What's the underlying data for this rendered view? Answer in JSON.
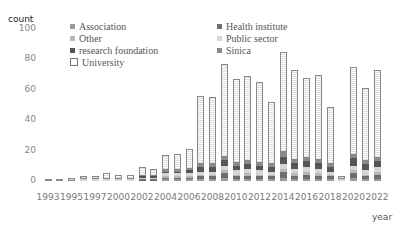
{
  "chart_data": {
    "type": "bar",
    "stacked": true,
    "title": "",
    "xlabel": "year",
    "ylabel": "count",
    "ylim": [
      0,
      100
    ],
    "yticks": [
      0,
      20,
      40,
      60,
      80,
      100
    ],
    "grid": false,
    "legend_position": "top-left inside",
    "categories": [
      "1993",
      "1994",
      "1995",
      "1996",
      "1997",
      "1998",
      "2000",
      "2001",
      "2002",
      "2003",
      "2004",
      "2005",
      "2006",
      "2007",
      "2008",
      "2009",
      "2010",
      "2011",
      "2012",
      "2013",
      "2014",
      "2015",
      "2016",
      "2017",
      "2018",
      "2019",
      "2020",
      "2021",
      "2022"
    ],
    "xtick_labels": [
      "1993",
      "1995",
      "1997",
      "2000",
      "2002",
      "2004",
      "2006",
      "2008",
      "2010",
      "2012",
      "2014",
      "2016",
      "2018",
      "2020",
      "2022"
    ],
    "series": [
      {
        "name": "Association",
        "color": "#9a9a9a",
        "values": [
          0,
          0,
          0,
          0,
          0,
          0,
          0,
          0,
          0,
          0,
          1,
          1,
          1,
          1,
          1,
          2,
          1,
          1,
          1,
          1,
          2,
          1,
          1,
          1,
          1,
          0,
          2,
          1,
          1
        ]
      },
      {
        "name": "Health institute",
        "color": "#6e6e6e",
        "values": [
          0,
          0,
          0,
          0,
          0,
          0,
          0,
          0,
          1,
          1,
          1,
          1,
          1,
          2,
          2,
          3,
          2,
          2,
          2,
          2,
          4,
          2,
          3,
          2,
          2,
          0,
          3,
          2,
          3
        ]
      },
      {
        "name": "Other",
        "color": "#b8b8b8",
        "values": [
          0,
          0,
          0,
          0,
          0,
          0,
          0,
          0,
          0,
          0,
          1,
          1,
          1,
          1,
          1,
          2,
          1,
          2,
          1,
          1,
          2,
          2,
          2,
          2,
          1,
          0,
          2,
          1,
          2
        ]
      },
      {
        "name": "Public sector",
        "color": "#d6d6d6",
        "values": [
          0,
          0,
          0,
          1,
          1,
          1,
          1,
          1,
          1,
          1,
          2,
          2,
          2,
          2,
          2,
          3,
          3,
          3,
          3,
          2,
          3,
          3,
          3,
          3,
          2,
          1,
          3,
          3,
          3
        ]
      },
      {
        "name": "research foundation",
        "color": "#555555",
        "values": [
          0,
          0,
          0,
          0,
          0,
          0,
          0,
          0,
          1,
          1,
          1,
          1,
          2,
          3,
          3,
          4,
          3,
          3,
          3,
          3,
          5,
          4,
          4,
          4,
          3,
          0,
          5,
          4,
          4
        ]
      },
      {
        "name": "Sinica",
        "color": "#8a8a8a",
        "values": [
          0,
          0,
          0,
          0,
          0,
          0,
          0,
          0,
          0,
          0,
          1,
          1,
          1,
          2,
          2,
          2,
          2,
          2,
          2,
          2,
          3,
          2,
          2,
          2,
          2,
          0,
          2,
          2,
          2
        ]
      },
      {
        "name": "University",
        "color": "#ffffff",
        "values": [
          1,
          1,
          2,
          2,
          2,
          4,
          3,
          3,
          6,
          5,
          10,
          11,
          13,
          45,
          44,
          61,
          55,
          56,
          53,
          41,
          66,
          59,
          53,
          56,
          38,
          2,
          58,
          48,
          58
        ]
      }
    ],
    "totals": [
      1,
      1,
      2,
      3,
      3,
      5,
      4,
      4,
      9,
      8,
      17,
      18,
      21,
      56,
      55,
      77,
      67,
      69,
      65,
      52,
      85,
      73,
      68,
      70,
      49,
      3,
      75,
      61,
      73
    ]
  },
  "axis": {
    "y_title": "count",
    "x_title": "year"
  },
  "legend": {
    "col1": [
      "Association",
      "Other",
      "research foundation",
      "University"
    ],
    "col2": [
      "Health institute",
      "Public sector",
      "Sinica"
    ]
  }
}
